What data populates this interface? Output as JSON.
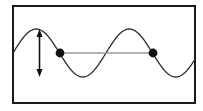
{
  "figure": {
    "canvas": {
      "width": 203,
      "height": 111
    },
    "background_color": "#ffffff"
  },
  "frame": {
    "name": "figure-border",
    "x": 13,
    "y": 6,
    "width": 182,
    "height": 97,
    "stroke_color": "#1a1a1a",
    "stroke_width": 2,
    "fill_color": "#ffffff"
  },
  "chart_data": {
    "type": "line",
    "title": "",
    "xlabel": "",
    "ylabel": "",
    "grid": false,
    "legend": false,
    "xlim": [
      13,
      195
    ],
    "ylim": [
      29,
      77
    ],
    "axis_visible": false,
    "series": [
      {
        "name": "sine-wave",
        "stroke_color": "#2b2b2b",
        "stroke_width": 1.3,
        "waveform": "sine",
        "baseline_y": 53,
        "amplitude": 24,
        "wavelength": 93,
        "phase_x_at_zero_rising": 13,
        "crest_y": 29,
        "trough_y": 77,
        "crests_x": [
          39,
          132
        ],
        "troughs_x": [
          86,
          178
        ],
        "zero_crossings_x": [
          13,
          60,
          106,
          153,
          195
        ],
        "x_start": 13,
        "x_end": 195
      }
    ]
  },
  "annotations": {
    "amplitude_arrow": {
      "name": "amplitude-double-arrow",
      "label": "",
      "x": 39.5,
      "y_top": 29,
      "y_bottom": 77,
      "color": "#111111",
      "stroke_width": 1.6,
      "head_width": 6,
      "head_length": 8,
      "double_headed": true,
      "measures": "peak-to-peak height"
    },
    "wavelength_line": {
      "name": "wavelength-measure-line",
      "label": "",
      "x_start": 60,
      "x_end": 153,
      "y": 53,
      "color": "#9a9a9a",
      "stroke_width": 1.6,
      "measures": "wavelength between equivalent points"
    },
    "markers": [
      {
        "name": "wave-point-left",
        "x": 60,
        "y": 53,
        "radius": 4.4,
        "fill_color": "#111111"
      },
      {
        "name": "wave-point-right",
        "x": 153,
        "y": 53,
        "radius": 4.4,
        "fill_color": "#111111"
      }
    ]
  }
}
